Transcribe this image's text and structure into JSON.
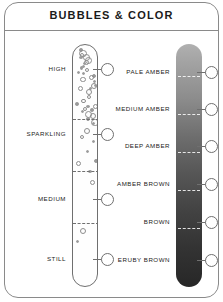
{
  "card": {
    "title": "BUBBLES & COLOR"
  },
  "bubbles_scale": {
    "name": "bubbles-scale",
    "levels": [
      {
        "label": "HIGH",
        "top": 66
      },
      {
        "label": "SPARKLING",
        "top": 131
      },
      {
        "label": "MEDIUM",
        "top": 196
      },
      {
        "label": "STILL",
        "top": 256
      }
    ],
    "dividers_top": [
      118,
      170,
      222
    ],
    "markers_top": [
      63,
      128,
      193,
      253
    ]
  },
  "color_scale": {
    "name": "color-scale",
    "levels": [
      {
        "label": "PALE AMBER",
        "top": 69
      },
      {
        "label": "MEDIUM AMBER",
        "top": 106
      },
      {
        "label": "DEEP AMBER",
        "top": 143
      },
      {
        "label": "AMBER BROWN",
        "top": 181
      },
      {
        "label": "BROWN",
        "top": 219
      },
      {
        "label": "ERUBY BROWN",
        "top": 257
      }
    ],
    "dividers_top": [
      76,
      114,
      152,
      190,
      228
    ],
    "markers_top": [
      66,
      103,
      140,
      178,
      216,
      254
    ],
    "gradient_top_color": "#b0b0b0",
    "gradient_bottom_color": "#272727"
  },
  "colors": {
    "ink": "#1b1b1b",
    "outline": "#6f6f6f",
    "frame": "#8a8a8a",
    "bubble_stroke": "#8d8d8d",
    "divider_light": "#ffffff",
    "background": "#ffffff"
  }
}
